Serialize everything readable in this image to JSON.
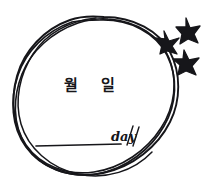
{
  "artwork": {
    "title": "Hand-drawn date circle sketch",
    "background_color": "#ffffff",
    "ink_color": "#16161a",
    "width": 210,
    "height": 190
  },
  "labels": {
    "month": "월",
    "day": "일",
    "day_script": "day"
  },
  "icons": {
    "star_top": "star-icon",
    "star_left": "star-icon",
    "star_bottom": "star-icon",
    "circle": "hand-drawn-circle",
    "baseline": "horizontal-rule"
  },
  "counts": {
    "stars": 3,
    "circle_passes": 4
  }
}
